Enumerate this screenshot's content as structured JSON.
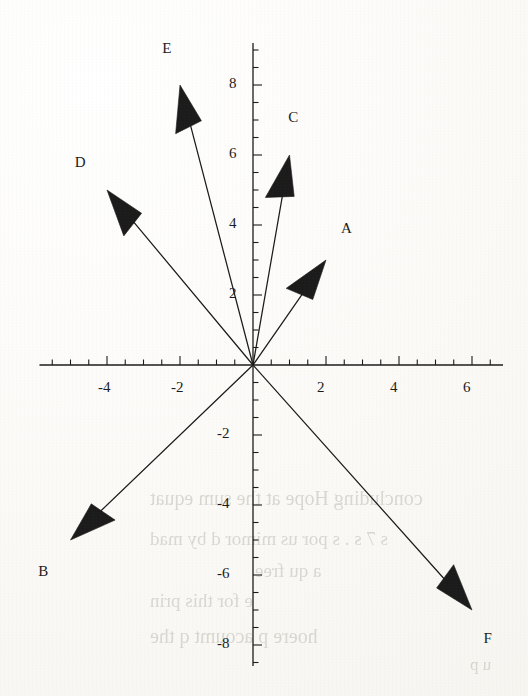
{
  "figure": {
    "kind": "vector-diagram",
    "background": "#fdfdfb",
    "ink_color": "#1b1b1b"
  },
  "chart_data": {
    "type": "scatter",
    "title": "",
    "xlabel": "",
    "ylabel": "",
    "grid": false,
    "legend": "none",
    "xlim": [
      -5.85,
      6.85
    ],
    "ylim": [
      -8.6,
      9.2
    ],
    "origin_px": [
      253,
      365
    ],
    "px_per_unit_x": 36.5,
    "px_per_unit_y": 35.0,
    "x_ticks_major": [
      -4,
      -2,
      2,
      4,
      6
    ],
    "x_tick_labels": [
      "-4",
      "-2",
      "2",
      "4",
      "6"
    ],
    "y_ticks_major": [
      8,
      6,
      4,
      2,
      -2,
      -4,
      -6,
      -8
    ],
    "y_tick_labels": [
      "8",
      "6",
      "4",
      "2",
      "-2",
      "-4",
      "-6",
      "-8"
    ],
    "x_minor_step": 0.5,
    "y_minor_step": 0.5,
    "vectors": [
      {
        "name": "A",
        "label": "A",
        "tail": [
          0,
          0
        ],
        "head": [
          2,
          3
        ],
        "label_pos": [
          2.55,
          3.85
        ]
      },
      {
        "name": "B",
        "label": "B",
        "tail": [
          0,
          0
        ],
        "head": [
          -5,
          -5
        ],
        "label_pos": [
          -5.75,
          -5.95
        ]
      },
      {
        "name": "C",
        "label": "C",
        "tail": [
          0,
          0
        ],
        "head": [
          1,
          6
        ],
        "label_pos": [
          1.1,
          7.02
        ]
      },
      {
        "name": "D",
        "label": "D",
        "tail": [
          0,
          0
        ],
        "head": [
          -4,
          5
        ],
        "label_pos": [
          -4.75,
          5.75
        ]
      },
      {
        "name": "E",
        "label": "E",
        "tail": [
          0,
          0
        ],
        "head": [
          -2,
          8
        ],
        "label_pos": [
          -2.35,
          9.0
        ]
      },
      {
        "name": "F",
        "label": "F",
        "tail": [
          0,
          0
        ],
        "head": [
          6,
          -7
        ],
        "label_pos": [
          6.45,
          -7.85
        ]
      }
    ]
  },
  "bleed_text": [
    {
      "text": "concluding Hope at the sum equat",
      "x": 150,
      "y": 487,
      "size": 20
    },
    {
      "text": "s  7  s .  s  por  us  mimor  d  by  mad",
      "x": 150,
      "y": 528,
      "size": 19
    },
    {
      "text": "a  qu  free",
      "x": 255,
      "y": 560,
      "size": 19
    },
    {
      "text": "e  for  this  prin",
      "x": 150,
      "y": 590,
      "size": 19
    },
    {
      "text": "hoere    p  acoumt    q  the",
      "x": 150,
      "y": 625,
      "size": 20
    },
    {
      "text": "u  p",
      "x": 470,
      "y": 655,
      "size": 17
    }
  ]
}
